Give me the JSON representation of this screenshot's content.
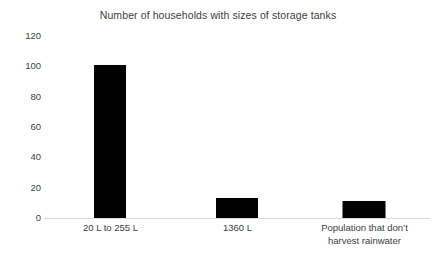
{
  "chart_data": {
    "type": "bar",
    "title": "Number of households with sizes of storage tanks",
    "xlabel": "",
    "ylabel": "",
    "categories": [
      "20 L to 255 L",
      "1360 L",
      "Population that don’t harvest rainwater"
    ],
    "category_lines": [
      [
        "20 L to 255 L"
      ],
      [
        "1360 L"
      ],
      [
        "Population that don’t",
        "harvest rainwater"
      ]
    ],
    "values": [
      101,
      13,
      11
    ],
    "ylim": [
      0,
      120
    ],
    "yticks": [
      0,
      20,
      40,
      60,
      80,
      100,
      120
    ],
    "ytick_labels": [
      "0",
      "20",
      "40",
      "60",
      "80",
      "100",
      "120"
    ],
    "grid": false,
    "legend": false,
    "bar_color": "#000000",
    "background_color": "#ffffff",
    "text_color": "#404040",
    "axis_line_color": "#d9d9d9"
  }
}
